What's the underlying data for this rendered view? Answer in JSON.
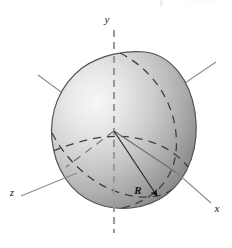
{
  "figure": {
    "background_color": "#ffffff",
    "width": 232,
    "height": 248
  },
  "axes": {
    "y_label": "y",
    "x_label": "x",
    "z_label": "z",
    "origin": {
      "x": 114,
      "y": 131
    },
    "axis_color": "#8a8a8a",
    "y_axis_style": "dashed",
    "x_axis_style": "solid",
    "z_axis_style": "solid"
  },
  "annotations": {
    "radius_label": "R",
    "radius_color": "#111111",
    "radius_arrow": "arrowhead"
  },
  "surface": {
    "name": "ovoid",
    "fill_light": "#f2f2f2",
    "fill_mid": "#c6c6c6",
    "fill_dark": "#8e8e8e",
    "outline_color": "#4a4a4a",
    "guide_curve_style": "dashed",
    "guide_curve_color": "#3f3f3f"
  }
}
